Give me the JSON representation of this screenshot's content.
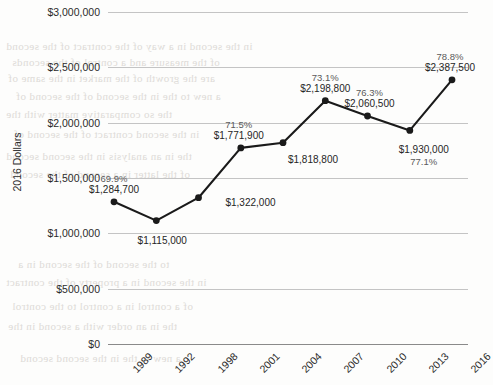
{
  "chart_data": {
    "type": "line",
    "title": "",
    "xlabel": "",
    "ylabel": "2016 Dollars",
    "categories": [
      "1989",
      "1992",
      "1998",
      "2001",
      "2004",
      "2007",
      "2010",
      "2013",
      "2016"
    ],
    "values": [
      1284700,
      1115000,
      1322000,
      1771900,
      1818800,
      2198800,
      2060500,
      1930000,
      2387500
    ],
    "value_labels": [
      "$1,284,700",
      "$1,115,000",
      "$1,322,000",
      "$1,771,900",
      "$1,818,800",
      "$2,198,800",
      "$2,060,500",
      "$1,930,000",
      "$2,387,500"
    ],
    "percent_labels": [
      "69.9%",
      "",
      "",
      "71.5%",
      "",
      "73.1%",
      "76.3%",
      "77.1%",
      "78.8%"
    ],
    "ylim": [
      0,
      3000000
    ],
    "ytick_labels": [
      "$3,000,000",
      "$2,500,000",
      "$2,000,000",
      "$1,500,000",
      "$1,000,000",
      "$500,000",
      "$0"
    ],
    "ytick_values": [
      3000000,
      2500000,
      2000000,
      1500000,
      1000000,
      500000,
      0
    ],
    "grid": true,
    "legend": "none",
    "series_color": "#1a1a1a",
    "grid_color": "#c4c4c4",
    "axis_color": "#8a8a8a"
  },
  "bleed_text": {
    "lines": [
      "in the second in a way of the contract of the second",
      "of the measure and a control of the seconds",
      "are the growth of the market in the same of",
      "a new to the in the second of the second of",
      "the so comparative matter with the",
      "in the second contract of the second of",
      "the in an analysis in the second second",
      "of the latter in a second of the second",
      "to the second of the second in a",
      "in the second in a property of the contract",
      "of a control in a control to the control",
      "the in an order with a second in the",
      "a new to the in the second second"
    ]
  }
}
